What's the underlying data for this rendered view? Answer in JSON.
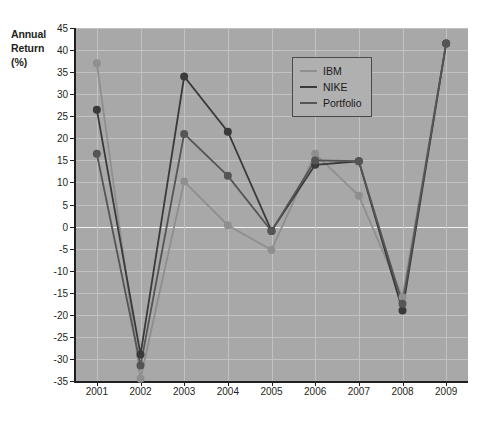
{
  "chart_data": {
    "type": "line",
    "title": "",
    "xlabel": "",
    "ylabel": "Annual Return (%)",
    "ylabel_lines": [
      "Annual",
      "Return",
      "(%)"
    ],
    "categories": [
      "2001",
      "2002",
      "2003",
      "2004",
      "2005",
      "2006",
      "2007",
      "2008",
      "2009"
    ],
    "x": [
      2001,
      2002,
      2003,
      2004,
      2005,
      2006,
      2007,
      2008,
      2009
    ],
    "ylim": [
      -35,
      45
    ],
    "yticks": [
      45,
      40,
      35,
      30,
      25,
      20,
      15,
      10,
      5,
      0,
      -5,
      -10,
      -15,
      -20,
      -25,
      -30,
      -35
    ],
    "ytick_labels": [
      "45",
      "40",
      "35",
      "30",
      "25",
      "20",
      "15",
      "10",
      "5",
      "0",
      "-5",
      "-10",
      "-15",
      "-20",
      "-25",
      "-30",
      "-35"
    ],
    "grid": true,
    "legend_position": "top-right",
    "series": [
      {
        "name": "IBM",
        "color": "#8f8f8f",
        "values": [
          37.0,
          -34.5,
          10.2,
          0.3,
          -5.3,
          16.5,
          7.0,
          -16.0,
          41.5
        ]
      },
      {
        "name": "NIKE",
        "color": "#3a3a3a",
        "values": [
          26.5,
          -29.0,
          34.0,
          21.5,
          -1.0,
          14.0,
          14.8,
          -19.0,
          41.5
        ]
      },
      {
        "name": "Portfolio",
        "color": "#555555",
        "values": [
          16.5,
          -31.5,
          21.0,
          11.5,
          -1.0,
          15.0,
          14.8,
          -17.5,
          41.5
        ]
      }
    ]
  },
  "legend": {
    "items": [
      {
        "label": "IBM"
      },
      {
        "label": "NIKE"
      },
      {
        "label": "Portfolio"
      }
    ]
  },
  "colors": {
    "plot_background": "#a8a8a8",
    "page_background": "#ffffff",
    "gridline": "#c2c2c2",
    "zero_line": "#f2f2f2",
    "axis": "#231f20",
    "ibm": "#8f8f8f",
    "nike": "#3a3a3a",
    "portfolio": "#555555"
  }
}
